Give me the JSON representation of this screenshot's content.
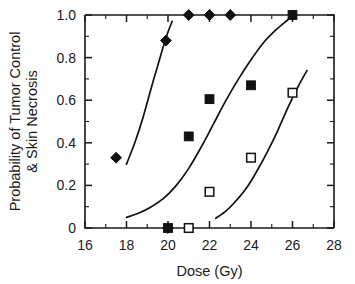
{
  "chart_data": {
    "type": "scatter",
    "title": "",
    "xlabel": "Dose (Gy)",
    "ylabel_line1": "Probability of Tumor Control",
    "ylabel_line2": "& Skin Necrosis",
    "xlim": [
      16,
      28
    ],
    "ylim": [
      0,
      1.0
    ],
    "grid": false,
    "legend": "none",
    "xticks": [
      16,
      18,
      20,
      22,
      24,
      26,
      28
    ],
    "xticklabels": [
      "16",
      "18",
      "20",
      "22",
      "24",
      "26",
      "28"
    ],
    "xminorticks": [
      17,
      19,
      21,
      23,
      25,
      27
    ],
    "yticks": [
      0,
      0.2,
      0.4,
      0.6,
      0.8,
      1.0
    ],
    "yticklabels": [
      "0",
      "0.2",
      "0.4",
      "0.6",
      "0.8",
      "1.0"
    ],
    "series": [
      {
        "name": "Tumor control (filled diamond)",
        "marker": "filled-diamond",
        "x": [
          17.5,
          19.9,
          20.0,
          21.0,
          22.0,
          23.0
        ],
        "y": [
          0.33,
          0.88,
          0.0,
          1.0,
          1.0,
          1.0
        ]
      },
      {
        "name": "Skin necrosis A (filled square)",
        "marker": "filled-square",
        "x": [
          20.0,
          21.0,
          22.0,
          24.0,
          26.0
        ],
        "y": [
          0.0,
          0.43,
          0.605,
          0.67,
          1.0
        ]
      },
      {
        "name": "Skin necrosis B (open square)",
        "marker": "open-square",
        "x": [
          21.0,
          22.0,
          24.0,
          26.0
        ],
        "y": [
          0.0,
          0.17,
          0.33,
          0.635
        ]
      }
    ],
    "curves": [
      {
        "name": "left sigmoid fit",
        "x": [
          18.0,
          18.4,
          18.8,
          19.2,
          19.5,
          19.8,
          20.0,
          20.2
        ],
        "y": [
          0.3,
          0.4,
          0.52,
          0.66,
          0.76,
          0.86,
          0.92,
          0.97
        ]
      },
      {
        "name": "middle sigmoid fit",
        "x": [
          18.0,
          18.6,
          19.2,
          19.8,
          20.4,
          21.0,
          21.6,
          22.2,
          22.8,
          23.4,
          24.0,
          24.6,
          25.2,
          25.8,
          26.0
        ],
        "y": [
          0.05,
          0.07,
          0.1,
          0.14,
          0.2,
          0.28,
          0.38,
          0.49,
          0.6,
          0.7,
          0.79,
          0.87,
          0.93,
          0.98,
          1.0
        ]
      },
      {
        "name": "right sigmoid fit",
        "x": [
          22.3,
          22.8,
          23.3,
          23.8,
          24.3,
          24.8,
          25.3,
          25.8,
          26.3,
          26.7
        ],
        "y": [
          0.045,
          0.08,
          0.13,
          0.19,
          0.27,
          0.36,
          0.46,
          0.57,
          0.67,
          0.74
        ]
      }
    ]
  }
}
